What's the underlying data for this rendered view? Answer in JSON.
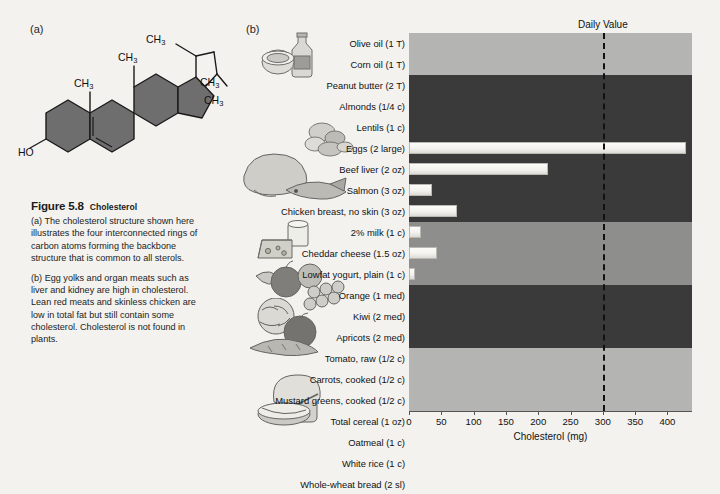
{
  "figure": {
    "panel_a_label": "(a)",
    "panel_b_label": "(b)",
    "number": "Figure 5.8",
    "title": "Cholesterol",
    "caption_a": "(a) The cholesterol structure shown here illustrates the four interconnected rings of carbon atoms forming the backbone structure that is common to all sterols.",
    "caption_b": "(b) Egg yolks and organ meats such as liver and kidney are high in cholesterol. Lean red meats and skinless chicken are low in total fat but still contain some cholesterol. Cholesterol is not found in plants."
  },
  "structure": {
    "hydroxyl_label": "HO",
    "methyl_labels": [
      "CH3",
      "CH3",
      "CH3",
      "CH3",
      "CH3"
    ],
    "ring_fill": "#6e6e6e",
    "line_color": "#1a1a1a"
  },
  "chart_data": {
    "type": "bar",
    "title": "",
    "xlabel": "Cholesterol (mg)",
    "ylabel": "",
    "xlim": [
      0,
      438
    ],
    "xticks": [
      0,
      50,
      100,
      150,
      200,
      250,
      300,
      350,
      400
    ],
    "xticklabels": [
      "0",
      "50",
      "100",
      "150",
      "200",
      "250",
      "300",
      "350",
      "400"
    ],
    "grid": false,
    "orientation": "horizontal",
    "annotations": [
      {
        "label": "Daily Value",
        "value": 300,
        "style": "dashed-vertical-line"
      }
    ],
    "categories": [
      "Olive oil (1 T)",
      "Corn oil (1 T)",
      "Peanut butter (2 T)",
      "Almonds (1/4 c)",
      "Lentils (1 c)",
      "Eggs (2 large)",
      "Beef liver (2 oz)",
      "Salmon (3 oz)",
      "Chicken breast, no skin (3 oz)",
      "2% milk (1 c)",
      "Cheddar cheese (1.5 oz)",
      "Lowfat yogurt, plain (1 c)",
      "Orange (1 med)",
      "Kiwi (2 med)",
      "Apricots (2 med)",
      "Tomato, raw (1/2 c)",
      "Carrots, cooked (1/2 c)",
      "Mustard greens, cooked (1/2 c)",
      "Total cereal (1 oz)",
      "Oatmeal (1 c)",
      "White rice (1 c)",
      "Whole-wheat bread (2 sl)"
    ],
    "values": [
      0,
      0,
      0,
      0,
      0,
      428,
      215,
      36,
      74,
      18,
      44,
      10,
      0,
      0,
      0,
      0,
      0,
      0,
      0,
      0,
      0,
      0
    ],
    "food_groups": [
      {
        "name": "Fats and oils",
        "rows": 2,
        "band_color": "#b4b4b2"
      },
      {
        "name": "Protein foods",
        "rows": 7,
        "band_color": "#3a3a3a"
      },
      {
        "name": "Milk and milk products",
        "rows": 3,
        "band_color": "#8e8e8c"
      },
      {
        "name": "Fruits",
        "rows": 3,
        "band_color": "#3a3a3a"
      },
      {
        "name": "Vegetables",
        "rows": 3,
        "band_color": "#b4b4b2"
      },
      {
        "name": "Grains",
        "rows": 4,
        "band_color": "#8e8e8c"
      }
    ],
    "bar_color": "#f4f3ef"
  },
  "illustrations": [
    {
      "name": "oil-bottle-and-tub",
      "group": "fats-and-oils"
    },
    {
      "name": "lentils-and-nuts",
      "group": "protein-foods"
    },
    {
      "name": "poultry-and-fish",
      "group": "protein-foods"
    },
    {
      "name": "cheese-and-milk-glass",
      "group": "milk-products"
    },
    {
      "name": "fruit-assortment",
      "group": "fruits"
    },
    {
      "name": "vegetable-assortment",
      "group": "vegetables"
    },
    {
      "name": "bread-and-cereal-bowl",
      "group": "grains"
    }
  ]
}
